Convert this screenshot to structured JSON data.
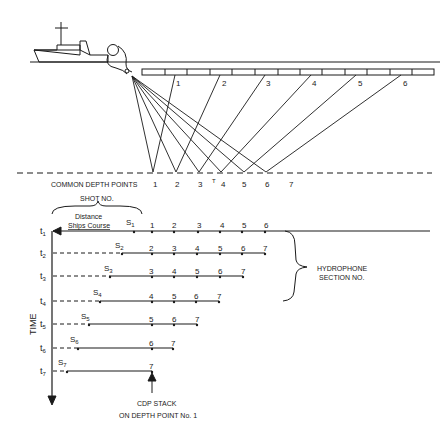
{
  "figure": {
    "top_panel": {
      "streamer_section_labels": [
        "1",
        "2",
        "3",
        "4",
        "5",
        "6"
      ],
      "depth_line_label": "COMMON DEPTH POINTS",
      "depth_point_labels": [
        "1",
        "2",
        "3",
        "4",
        "5",
        "6",
        "7"
      ],
      "marker_label": "T"
    },
    "bottom_panel": {
      "shot_no_label": "SHOT NO.",
      "distance_label_line1": "Distance",
      "distance_label_line2": "Ships Course",
      "time_axis_label": "TIME",
      "hydrophone_label_line1": "HYDROPHONE",
      "hydrophone_label_line2": "SECTION NO.",
      "cdp_label_line1": "CDP STACK",
      "cdp_label_line2": "ON DEPTH POINT No. 1",
      "rows": [
        {
          "t": "t",
          "t_sub": "1",
          "shot": "S",
          "shot_sub": "1",
          "sections": [
            "1",
            "2",
            "3",
            "4",
            "5",
            "6"
          ]
        },
        {
          "t": "t",
          "t_sub": "2",
          "shot": "S",
          "shot_sub": "2",
          "sections": [
            "2",
            "3",
            "4",
            "5",
            "6",
            "7"
          ]
        },
        {
          "t": "t",
          "t_sub": "3",
          "shot": "S",
          "shot_sub": "3",
          "sections": [
            "3",
            "4",
            "5",
            "6",
            "7"
          ]
        },
        {
          "t": "t",
          "t_sub": "4",
          "shot": "S",
          "shot_sub": "4",
          "sections": [
            "4",
            "5",
            "6",
            "7"
          ]
        },
        {
          "t": "t",
          "t_sub": "5",
          "shot": "S",
          "shot_sub": "5",
          "sections": [
            "5",
            "6",
            "7"
          ]
        },
        {
          "t": "t",
          "t_sub": "6",
          "shot": "S",
          "shot_sub": "6",
          "sections": [
            "6",
            "7"
          ]
        },
        {
          "t": "t",
          "t_sub": "7",
          "shot": "S",
          "shot_sub": "7",
          "sections": [
            "7"
          ]
        }
      ]
    },
    "colors": {
      "ink": "#1a1a1a",
      "background": "#ffffff"
    }
  }
}
